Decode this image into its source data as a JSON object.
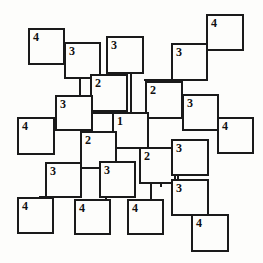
{
  "figure": {
    "type": "node-link-diagram",
    "title": "",
    "width": 263,
    "height": 263,
    "background_color": "#fdfdfb",
    "stroke_color": "#1a1a1a",
    "stroke_width": 2,
    "node_shape": "square",
    "node_fill": "#fdfdfb"
  },
  "chart_data": {
    "type": "diagram",
    "title": "",
    "xlabel": "",
    "ylabel": "",
    "node_labels": [
      "4",
      "3",
      "3",
      "4",
      "3",
      "2",
      "2",
      "3",
      "3",
      "4",
      "1",
      "4",
      "2",
      "2",
      "3",
      "3",
      "3",
      "3",
      "4",
      "4",
      "4",
      "4"
    ],
    "level_counts": {
      "1": 1,
      "2": 4,
      "3": 9,
      "4": 8
    },
    "nodes": [
      {
        "id": "n1",
        "label": "4",
        "x": 28,
        "y": 28,
        "w": 37,
        "h": 37
      },
      {
        "id": "n2",
        "label": "3",
        "x": 64,
        "y": 42,
        "w": 37,
        "h": 37
      },
      {
        "id": "n3",
        "label": "3",
        "x": 106,
        "y": 36,
        "w": 38,
        "h": 38
      },
      {
        "id": "n4",
        "label": "4",
        "x": 206,
        "y": 14,
        "w": 38,
        "h": 37
      },
      {
        "id": "n5",
        "label": "3",
        "x": 171,
        "y": 43,
        "w": 37,
        "h": 38
      },
      {
        "id": "n6",
        "label": "2",
        "x": 90,
        "y": 74,
        "w": 38,
        "h": 38
      },
      {
        "id": "n7",
        "label": "2",
        "x": 145,
        "y": 81,
        "w": 38,
        "h": 38
      },
      {
        "id": "n8",
        "label": "3",
        "x": 55,
        "y": 95,
        "w": 38,
        "h": 36
      },
      {
        "id": "n9",
        "label": "3",
        "x": 182,
        "y": 94,
        "w": 37,
        "h": 37
      },
      {
        "id": "n10",
        "label": "4",
        "x": 17,
        "y": 117,
        "w": 38,
        "h": 38
      },
      {
        "id": "n11",
        "label": "1",
        "x": 112,
        "y": 112,
        "w": 37,
        "h": 37
      },
      {
        "id": "n12",
        "label": "4",
        "x": 217,
        "y": 117,
        "w": 37,
        "h": 37
      },
      {
        "id": "n13",
        "label": "2",
        "x": 80,
        "y": 131,
        "w": 37,
        "h": 38
      },
      {
        "id": "n14",
        "label": "2",
        "x": 139,
        "y": 147,
        "w": 37,
        "h": 37
      },
      {
        "id": "n15",
        "label": "3",
        "x": 171,
        "y": 139,
        "w": 38,
        "h": 37
      },
      {
        "id": "n16",
        "label": "3",
        "x": 171,
        "y": 179,
        "w": 38,
        "h": 37
      },
      {
        "id": "n17",
        "label": "3",
        "x": 45,
        "y": 162,
        "w": 37,
        "h": 36
      },
      {
        "id": "n18",
        "label": "3",
        "x": 99,
        "y": 161,
        "w": 37,
        "h": 37
      },
      {
        "id": "n19",
        "label": "4",
        "x": 17,
        "y": 197,
        "w": 37,
        "h": 37
      },
      {
        "id": "n20",
        "label": "4",
        "x": 74,
        "y": 199,
        "w": 37,
        "h": 36
      },
      {
        "id": "n21",
        "label": "4",
        "x": 127,
        "y": 199,
        "w": 37,
        "h": 36
      },
      {
        "id": "n22",
        "label": "4",
        "x": 191,
        "y": 214,
        "w": 38,
        "h": 38
      }
    ],
    "edges": [
      {
        "from": "n1",
        "to": "n2",
        "orient": "h",
        "x": 64,
        "y": 46,
        "len": 37
      },
      {
        "from": "n2",
        "to": "n6",
        "orient": "v",
        "x": 79,
        "y": 77,
        "len": 22
      },
      {
        "from": "n3",
        "to": "n6",
        "orient": "v",
        "x": 110,
        "y": 71,
        "len": 9
      },
      {
        "from": "n3",
        "to": "n11",
        "orient": "v",
        "x": 130,
        "y": 72,
        "len": 42
      },
      {
        "from": "n6",
        "to": "n8",
        "orient": "h",
        "x": 91,
        "y": 110,
        "len": 24
      },
      {
        "from": "n4",
        "to": "n5",
        "orient": "h",
        "x": 172,
        "y": 47,
        "len": 36
      },
      {
        "from": "n5",
        "to": "n7",
        "orient": "h",
        "x": 144,
        "y": 79,
        "len": 29
      },
      {
        "from": "n5",
        "to": "n9",
        "orient": "v",
        "x": 179,
        "y": 79,
        "len": 17
      },
      {
        "from": "n7",
        "to": "n11",
        "orient": "h",
        "x": 146,
        "y": 117,
        "len": 4
      },
      {
        "from": "n8",
        "to": "n10",
        "orient": "h",
        "x": 54,
        "y": 129,
        "w": 2,
        "len": 4
      },
      {
        "from": "n8",
        "to": "n11",
        "orient": "h",
        "x": 92,
        "y": 112,
        "len": 22
      },
      {
        "from": "n9",
        "to": "n12",
        "orient": "h",
        "x": 206,
        "y": 129,
        "len": 14
      },
      {
        "from": "n11",
        "to": "n13",
        "orient": "h",
        "x": 110,
        "y": 148,
        "len": 6
      },
      {
        "from": "n11",
        "to": "n14",
        "orient": "h",
        "x": 116,
        "y": 147,
        "len": 26
      },
      {
        "from": "n13",
        "to": "n17",
        "orient": "h",
        "x": 81,
        "y": 166,
        "len": 22
      },
      {
        "from": "n13",
        "to": "n18",
        "orient": "v",
        "x": 107,
        "y": 155,
        "len": 12
      },
      {
        "from": "n14",
        "to": "n15",
        "orient": "h",
        "x": 172,
        "y": 151,
        "len": 4
      },
      {
        "from": "n14",
        "to": "n16",
        "orient": "v",
        "x": 160,
        "y": 181,
        "len": 6
      },
      {
        "from": "n15",
        "to": "n16",
        "orient": "v",
        "x": 177,
        "y": 175,
        "len": 6
      },
      {
        "from": "n16",
        "to": "n22",
        "orient": "h",
        "x": 190,
        "y": 214,
        "len": 6
      },
      {
        "from": "n17",
        "to": "n19",
        "orient": "h",
        "x": 39,
        "y": 196,
        "len": 8
      },
      {
        "from": "n18",
        "to": "n20",
        "orient": "v",
        "x": 105,
        "y": 197,
        "len": 5
      },
      {
        "from": "n18",
        "to": "n21",
        "orient": "h",
        "x": 133,
        "y": 199,
        "len": 8
      },
      {
        "from": "n14",
        "to": "n21",
        "orient": "v",
        "x": 150,
        "y": 184,
        "len": 16
      }
    ]
  }
}
